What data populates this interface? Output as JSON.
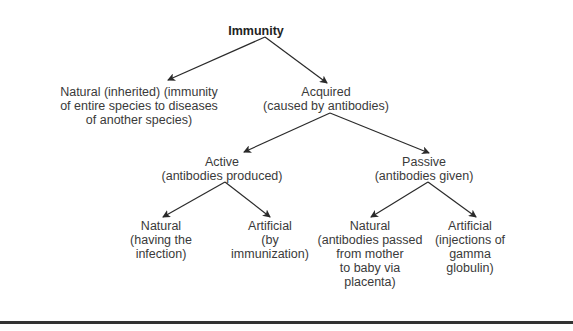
{
  "diagram": {
    "title": "Immunity",
    "nodes": {
      "immunity": {
        "lines": [
          "Immunity"
        ]
      },
      "natural_inherited": {
        "lines": [
          "Natural (inherited) (immunity",
          "of entire species to diseases",
          "of another species)"
        ]
      },
      "acquired": {
        "lines": [
          "Acquired",
          "(caused by antibodies)"
        ]
      },
      "active": {
        "lines": [
          "Active",
          "(antibodies produced)"
        ]
      },
      "passive": {
        "lines": [
          "Passive",
          "(antibodies given)"
        ]
      },
      "active_natural": {
        "lines": [
          "Natural",
          "(having the",
          "infection)"
        ]
      },
      "active_artificial": {
        "lines": [
          "Artificial",
          "(by",
          "immunization)"
        ]
      },
      "passive_natural": {
        "lines": [
          "Natural",
          "(antibodies passed",
          "from mother",
          "to baby via",
          "placenta)"
        ]
      },
      "passive_artificial": {
        "lines": [
          "Artificial",
          "(injections of",
          "gamma",
          "globulin)"
        ]
      }
    },
    "edges": [
      [
        "immunity",
        "natural_inherited"
      ],
      [
        "immunity",
        "acquired"
      ],
      [
        "acquired",
        "active"
      ],
      [
        "acquired",
        "passive"
      ],
      [
        "active",
        "active_natural"
      ],
      [
        "active",
        "active_artificial"
      ],
      [
        "passive",
        "passive_natural"
      ],
      [
        "passive",
        "passive_artificial"
      ]
    ],
    "colors": {
      "text": "#3a3a3a",
      "arrow": "#2a2a2a",
      "rule": "#333333"
    }
  }
}
